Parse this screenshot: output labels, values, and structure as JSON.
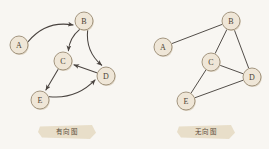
{
  "canvas": {
    "width": 269,
    "height": 149,
    "background": "#f8f6f2"
  },
  "palette": {
    "node_fill": "#efe6d7",
    "node_stroke": "#9a8b74",
    "node_shadow": "#d8cdb9",
    "edge_stroke": "#4a4440",
    "label_color": "#4a3f33",
    "caption_fill": "#e7dcc6",
    "caption_text": "#5a4b3a"
  },
  "figures": [
    {
      "id": "directed-graph",
      "caption": "有向图",
      "caption_box": {
        "x": 38,
        "y": 125,
        "width": 58,
        "height": 14
      },
      "nodes": [
        {
          "id": "A",
          "label": "A",
          "x": 19,
          "y": 45,
          "r": 9
        },
        {
          "id": "B",
          "label": "B",
          "x": 84,
          "y": 21,
          "r": 9
        },
        {
          "id": "C",
          "label": "C",
          "x": 63,
          "y": 61,
          "r": 9
        },
        {
          "id": "D",
          "label": "D",
          "x": 106,
          "y": 76,
          "r": 9
        },
        {
          "id": "E",
          "label": "E",
          "x": 40,
          "y": 100,
          "r": 9
        }
      ],
      "edges": [
        {
          "from": "A",
          "to": "B",
          "directed": true,
          "curve": -14
        },
        {
          "from": "B",
          "to": "C",
          "directed": true,
          "curve": 5
        },
        {
          "from": "B",
          "to": "D",
          "directed": true,
          "curve": 10
        },
        {
          "from": "D",
          "to": "C",
          "directed": true,
          "curve": 0
        },
        {
          "from": "C",
          "to": "E",
          "directed": true,
          "curve": 0
        },
        {
          "from": "E",
          "to": "D",
          "directed": true,
          "curve": 12
        }
      ]
    },
    {
      "id": "undirected-graph",
      "caption": "无向图",
      "caption_box": {
        "x": 177,
        "y": 125,
        "width": 58,
        "height": 14
      },
      "nodes": [
        {
          "id": "A",
          "label": "A",
          "x": 163,
          "y": 47,
          "r": 9
        },
        {
          "id": "B",
          "label": "B",
          "x": 231,
          "y": 21,
          "r": 9
        },
        {
          "id": "C",
          "label": "C",
          "x": 211,
          "y": 62,
          "r": 9
        },
        {
          "id": "D",
          "label": "D",
          "x": 252,
          "y": 77,
          "r": 9
        },
        {
          "id": "E",
          "label": "E",
          "x": 186,
          "y": 101,
          "r": 9
        }
      ],
      "edges": [
        {
          "from": "A",
          "to": "B",
          "directed": false,
          "curve": 0
        },
        {
          "from": "B",
          "to": "C",
          "directed": false,
          "curve": 0
        },
        {
          "from": "B",
          "to": "D",
          "directed": false,
          "curve": 0
        },
        {
          "from": "C",
          "to": "D",
          "directed": false,
          "curve": 0
        },
        {
          "from": "C",
          "to": "E",
          "directed": false,
          "curve": 0
        },
        {
          "from": "E",
          "to": "D",
          "directed": false,
          "curve": 0
        }
      ]
    }
  ]
}
